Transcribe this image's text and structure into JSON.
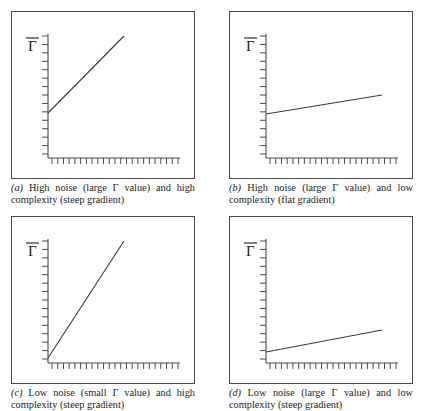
{
  "figure": {
    "y_axis_label": "Γ̄",
    "panels": [
      {
        "id": "a",
        "tag": "(a)",
        "caption": "High noise (large Γ value) and high complexity (steep gradient)",
        "noise": "high",
        "complexity": "high",
        "gradient": "steep"
      },
      {
        "id": "b",
        "tag": "(b)",
        "caption": "High noise (large Γ value) and low complexity (flat gradient)",
        "noise": "high",
        "complexity": "low",
        "gradient": "flat"
      },
      {
        "id": "c",
        "tag": "(c)",
        "caption": "Low noise (small Γ value) and high complexity (steep gradient)",
        "noise": "low",
        "complexity": "high",
        "gradient": "steep"
      },
      {
        "id": "d",
        "tag": "(d)",
        "caption": "Low noise (large Γ value) and low complexity (steep gradient)",
        "noise": "low",
        "complexity": "low",
        "gradient": "steep"
      }
    ]
  },
  "chart_data": [
    {
      "type": "line",
      "panel": "a",
      "title": "High noise (large Γ value) and high complexity (steep gradient)",
      "xlabel": "",
      "ylabel": "Γ̄",
      "xlim": [
        0,
        1
      ],
      "ylim": [
        0,
        1
      ],
      "grid": false,
      "legend": "none",
      "x_ticks": 23,
      "y_ticks": 15,
      "tick_labels": [],
      "series": [
        {
          "name": "error",
          "intercept": 0.29,
          "slope": 0.64,
          "x": [
            0.0,
            0.57
          ],
          "y": [
            0.29,
            0.66
          ]
        }
      ]
    },
    {
      "type": "line",
      "panel": "b",
      "title": "High noise (large Γ value) and low complexity (flat gradient)",
      "xlabel": "",
      "ylabel": "Γ̄",
      "xlim": [
        0,
        1
      ],
      "ylim": [
        0,
        1
      ],
      "grid": false,
      "legend": "none",
      "x_ticks": 23,
      "y_ticks": 15,
      "tick_labels": [],
      "series": [
        {
          "name": "error",
          "intercept": 0.29,
          "slope": 0.12,
          "x": [
            0.0,
            0.87
          ],
          "y": [
            0.29,
            0.4
          ]
        }
      ]
    },
    {
      "type": "line",
      "panel": "c",
      "title": "Low noise (small Γ value) and high complexity (steep gradient)",
      "xlabel": "",
      "ylabel": "Γ̄",
      "xlim": [
        0,
        1
      ],
      "ylim": [
        0,
        1
      ],
      "grid": false,
      "legend": "none",
      "x_ticks": 23,
      "y_ticks": 15,
      "tick_labels": [],
      "series": [
        {
          "name": "error",
          "intercept": 0.05,
          "slope": 1.1,
          "x": [
            0.0,
            0.57
          ],
          "y": [
            0.05,
            0.68
          ]
        }
      ]
    },
    {
      "type": "line",
      "panel": "d",
      "title": "Low noise (large Γ value) and low complexity (steep gradient)",
      "xlabel": "",
      "ylabel": "Γ̄",
      "xlim": [
        0,
        1
      ],
      "ylim": [
        0,
        1
      ],
      "grid": false,
      "legend": "none",
      "x_ticks": 23,
      "y_ticks": 15,
      "tick_labels": [],
      "series": [
        {
          "name": "error",
          "intercept": 0.07,
          "slope": 0.14,
          "x": [
            0.0,
            0.87
          ],
          "y": [
            0.07,
            0.19
          ]
        }
      ]
    }
  ],
  "colors": {
    "line": "#3a3a3a",
    "axis": "#4a4a4a",
    "border": "#4a4a4a",
    "text": "#1c1c1c",
    "background": "#ffffff"
  }
}
